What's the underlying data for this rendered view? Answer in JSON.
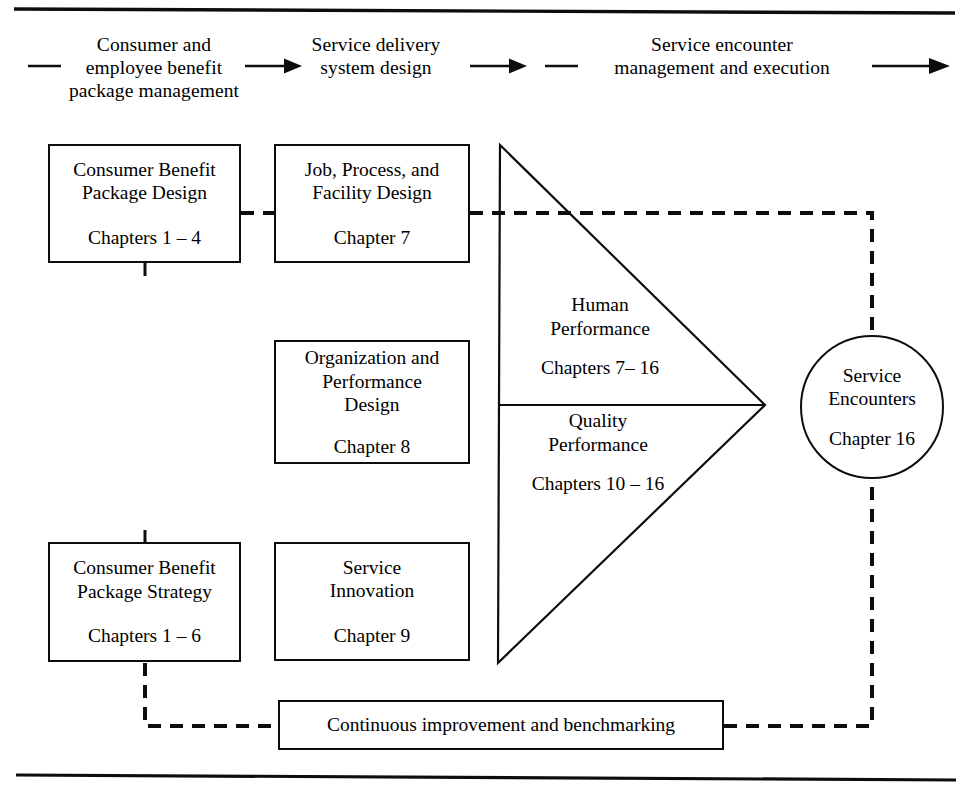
{
  "diagram": {
    "frame": {
      "top_rule": "horizontal-rule",
      "bottom_rule": "horizontal-rule"
    },
    "flow_header": {
      "lead_dash": "dash",
      "stages": [
        {
          "label": "Consumer and\nemployee benefit\npackage management",
          "connector": "arrow-right-icon"
        },
        {
          "label": "Service delivery\nsystem design",
          "connector": "arrow-right-icon"
        },
        {
          "label": "Service encounter\nmanagement and execution",
          "connector": "arrow-right-icon"
        }
      ]
    },
    "nodes": {
      "cbp_design": {
        "title": "Consumer Benefit\nPackage Design",
        "chapters": "Chapters 1 – 4"
      },
      "job_process": {
        "title": "Job, Process, and\nFacility Design",
        "chapters": "Chapter 7"
      },
      "org_perf": {
        "title": "Organization and\nPerformance\nDesign",
        "chapters": "Chapter 8"
      },
      "cbp_strategy": {
        "title": "Consumer Benefit\nPackage Strategy",
        "chapters": "Chapters 1 – 6"
      },
      "service_innovation": {
        "title": "Service\nInnovation",
        "chapters": "Chapter 9"
      },
      "continuous_improvement": {
        "label": "Continuous improvement and benchmarking"
      }
    },
    "triangle": {
      "upper": {
        "name": "Human\nPerformance",
        "chapters": "Chapters 7– 16"
      },
      "lower": {
        "name": "Quality\nPerformance",
        "chapters": "Chapters 10 – 16"
      }
    },
    "circle": {
      "name": "Service\nEncounters",
      "chapters": "Chapter 16"
    },
    "colors": {
      "line": "#0d0d0d",
      "background": "#ffffff",
      "text": "#000000"
    }
  }
}
